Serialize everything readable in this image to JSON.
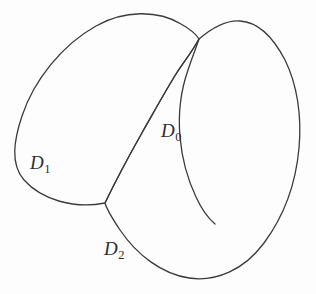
{
  "figure": {
    "background_color": "#fdfdfd",
    "stroke_color": "#3a3a3a",
    "stroke_width": 1.3,
    "width": 316,
    "height": 294
  },
  "labels": {
    "d0": {
      "base": "D",
      "sub": "0",
      "full": "D0",
      "x": 161,
      "y": 121
    },
    "d1": {
      "base": "D",
      "sub": "1",
      "full": "D1",
      "x": 30,
      "y": 153
    },
    "d2": {
      "base": "D",
      "sub": "2",
      "full": "D2",
      "x": 104,
      "y": 239
    }
  },
  "curves": {
    "curve_left": {
      "name": "left-closed-curve",
      "path": "M 105 203 C 74 209, 42 200, 24 180 C 10 164, 14 140, 22 116 C 34 80, 62 45, 96 26 C 124 10, 158 10, 181 24 C 190 29, 196 34, 199 39 C 192 52, 183 63, 176 74 C 166 90, 155 110, 143 131 C 130 154, 117 178, 105 203 Z"
    },
    "curve_right": {
      "name": "right-closed-curve",
      "path": "M 199 39 C 212 28, 226 20, 240 21 C 258 22, 273 37, 285 60 C 297 84, 302 116, 299 148 C 296 182, 284 216, 264 243 C 244 270, 216 282, 189 278 C 162 274, 137 255, 120 230 C 112 218, 107 210, 105 203 C 117 178, 130 154, 143 131 C 155 110, 166 90, 176 74 C 183 63, 192 52, 199 39 Z"
    },
    "divider": {
      "name": "interior-dividing-arc",
      "path": "M 199 39 C 196 48, 192 58, 188 70 C 181 90, 178 114, 180 137 C 182 160, 188 180, 196 197 C 202 210, 209 219, 215 224"
    }
  },
  "regions": [
    {
      "name": "D0",
      "description": "lens-shaped intersection region",
      "label_key": "d0"
    },
    {
      "name": "D1",
      "description": "left domain",
      "label_key": "d1"
    },
    {
      "name": "D2",
      "description": "lower-right domain",
      "label_key": "d2"
    }
  ]
}
